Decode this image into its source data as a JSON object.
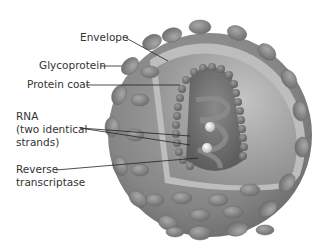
{
  "diagram": {
    "labels": {
      "envelope": "Envelope",
      "glycoprotein": "Glycoprotein",
      "protein_coat": "Protein coat",
      "rna_line1": "RNA",
      "rna_line2": "(two identical",
      "rna_line3": "strands)",
      "rt_line1": "Reverse",
      "rt_line2": "transcriptase"
    },
    "colors": {
      "background": "#ffffff",
      "label_text": "#333333",
      "leader_line": "#222222",
      "sphere_outer": "#8a8a8a",
      "sphere_inner": "#a8a8a8",
      "envelope_band": "#bdbdbd",
      "spike_head": "#888888",
      "core": "#6e6e6e",
      "core_bead": "#7a7a7a"
    }
  }
}
